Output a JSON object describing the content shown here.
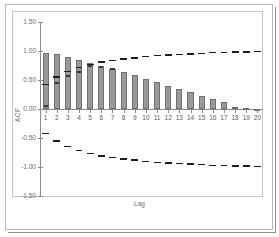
{
  "chart_data": {
    "type": "bar",
    "title": "",
    "subtitle": "",
    "xlabel": "Lag",
    "ylabel": "ACF",
    "ylim": [
      -1.5,
      1.5
    ],
    "xlim": [
      0.5,
      20.5
    ],
    "grid": false,
    "legend": null,
    "ytick_labels": [
      "1.50",
      "1.00",
      "0.50",
      "0.00",
      "-0.50",
      "-1.00",
      "-1.50"
    ],
    "ytick_values": [
      1.5,
      1.0,
      0.5,
      0.0,
      -0.5,
      -1.0,
      -1.5
    ],
    "categories": [
      1,
      2,
      3,
      4,
      5,
      6,
      7,
      8,
      9,
      10,
      11,
      12,
      13,
      14,
      15,
      16,
      17,
      18,
      19,
      20
    ],
    "xtick_labels": [
      "1",
      "2",
      "3",
      "4",
      "5",
      "6",
      "7",
      "8",
      "9",
      "10",
      "11",
      "12",
      "13",
      "14",
      "15",
      "16",
      "17",
      "18",
      "19",
      "20"
    ],
    "series": [
      {
        "name": "ACF",
        "kind": "bar",
        "color": "#9a9a9a",
        "values": [
          0.97,
          0.94,
          0.89,
          0.85,
          0.79,
          0.74,
          0.69,
          0.63,
          0.58,
          0.51,
          0.46,
          0.4,
          0.35,
          0.29,
          0.22,
          0.18,
          0.12,
          0.04,
          0.01,
          0.0
        ]
      },
      {
        "name": "marker",
        "kind": "segment-overlay",
        "color": "#3a3a3a",
        "values": [
          0.05,
          0.45,
          0.57,
          0.63,
          0.75,
          0.72,
          0.69,
          null,
          null,
          null,
          null,
          null,
          null,
          null,
          null,
          null,
          null,
          null,
          null,
          null
        ]
      },
      {
        "name": "upper confidence limit",
        "kind": "dashed-line",
        "color": "#1d1d1d",
        "values": [
          0.42,
          0.55,
          0.65,
          0.72,
          0.77,
          0.81,
          0.84,
          0.86,
          0.88,
          0.9,
          0.92,
          0.93,
          0.94,
          0.95,
          0.96,
          0.97,
          0.97,
          0.98,
          0.98,
          0.99
        ]
      },
      {
        "name": "lower confidence limit",
        "kind": "dashed-line",
        "color": "#1d1d1d",
        "values": [
          -0.42,
          -0.55,
          -0.65,
          -0.72,
          -0.77,
          -0.81,
          -0.84,
          -0.86,
          -0.88,
          -0.9,
          -0.92,
          -0.93,
          -0.94,
          -0.95,
          -0.96,
          -0.97,
          -0.97,
          -0.98,
          -0.98,
          -0.99
        ]
      }
    ]
  }
}
